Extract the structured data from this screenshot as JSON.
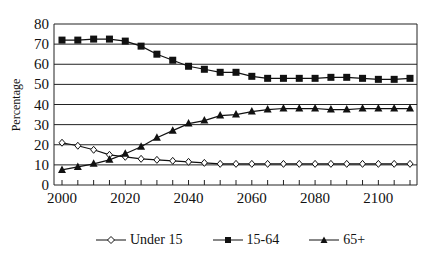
{
  "chart_data": {
    "type": "line",
    "title": "",
    "xlabel": "",
    "ylabel": "Percentage",
    "ylim": [
      0,
      80
    ],
    "xlim": [
      2000,
      2110
    ],
    "grid": "horizontal",
    "legend_position": "bottom",
    "y_ticks": [
      0,
      10,
      20,
      30,
      40,
      50,
      60,
      70,
      80
    ],
    "x_tick_labels": [
      2000,
      2020,
      2040,
      2060,
      2080,
      2100
    ],
    "x": [
      2000,
      2005,
      2010,
      2015,
      2020,
      2025,
      2030,
      2035,
      2040,
      2045,
      2050,
      2055,
      2060,
      2065,
      2070,
      2075,
      2080,
      2085,
      2090,
      2095,
      2100,
      2105,
      2110
    ],
    "series": [
      {
        "name": "Under 15",
        "marker": "diamond-open",
        "values": [
          21,
          19.5,
          17.5,
          15,
          14,
          13,
          12.5,
          12,
          11.5,
          11,
          10.5,
          10.5,
          10.5,
          10.5,
          10.5,
          10.5,
          10.5,
          10.5,
          10.5,
          10.5,
          10.5,
          10.5,
          10.5
        ]
      },
      {
        "name": "15-64",
        "marker": "square-filled",
        "values": [
          72,
          72,
          72.5,
          72.5,
          71.5,
          69,
          65,
          62,
          59,
          57.5,
          56,
          56,
          54,
          53,
          53,
          53,
          53,
          53.5,
          53.5,
          53,
          52.5,
          52.5,
          53
        ]
      },
      {
        "name": "65+",
        "marker": "triangle-filled",
        "values": [
          7.5,
          9,
          10.5,
          12.5,
          15.5,
          19,
          23.5,
          27,
          30.5,
          32,
          34.5,
          35,
          36.5,
          37.5,
          38,
          38,
          38,
          37.5,
          37.5,
          38,
          38,
          38,
          38
        ]
      }
    ]
  },
  "legend": {
    "items": [
      {
        "label": "Under 15"
      },
      {
        "label": "15-64"
      },
      {
        "label": "65+"
      }
    ]
  }
}
